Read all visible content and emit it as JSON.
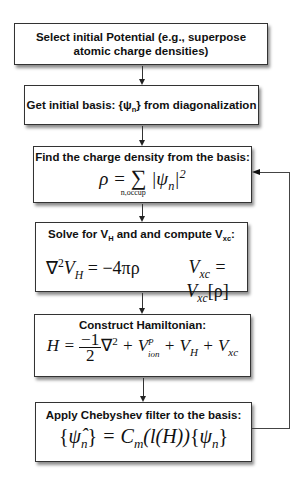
{
  "steps": [
    {
      "id": "select-potential",
      "title": "Select  initial Potential (e.g., superpose atomic charge densities)"
    },
    {
      "id": "initial-basis",
      "title_prefix": "Get initial basis:  {ψ",
      "title_sub": "n",
      "title_suffix": "} from diagonalization"
    },
    {
      "id": "charge-density",
      "title": "Find the charge density from the basis:",
      "equation": {
        "lhs": "ρ =",
        "sum": "∑",
        "sum_under": "n,occup",
        "term": "|ψ",
        "term_sub": "n",
        "term_close": "|",
        "power": "2"
      }
    },
    {
      "id": "solve-vh",
      "title_prefix": "Solve for V",
      "title_sub1": "H",
      "title_mid": " and and compute V",
      "title_sub2": "xc",
      "title_suffix": ":",
      "eq1": {
        "a": "∇",
        "a_sup": "2",
        "b": "V",
        "b_sub": "H",
        "c": " = −4πρ"
      },
      "eq2": {
        "a": "V",
        "a_sub": "xc",
        "b": " = V",
        "b_sub": "xc",
        "c": "[ρ]"
      }
    },
    {
      "id": "hamiltonian",
      "title": "Construct Hamiltonian:",
      "equation": {
        "lhs": "H = ",
        "num": "−1",
        "den": "2",
        "lap": "∇",
        "lap_sup": "2",
        "t1": " + V",
        "t1_sub": "ion",
        "t1_sup": "P",
        "t2": " + V",
        "t2_sub": "H",
        "t3": " + V",
        "t3_sub": "xc"
      }
    },
    {
      "id": "chebyshev",
      "title": "Apply Chebyshev filter to the basis:",
      "equation": {
        "lhs_open": "{",
        "lhs": "ψ̂",
        "lhs_sub": "n",
        "lhs_close": "}",
        "mid": " = C",
        "mid_sub": "m",
        "arg": "(l(H))",
        "rhs_open": "{",
        "rhs": "ψ",
        "rhs_sub": "n",
        "rhs_close": "}"
      }
    }
  ],
  "colors": {
    "border": "#333333",
    "arrow": "#222222",
    "background": "#ffffff"
  }
}
